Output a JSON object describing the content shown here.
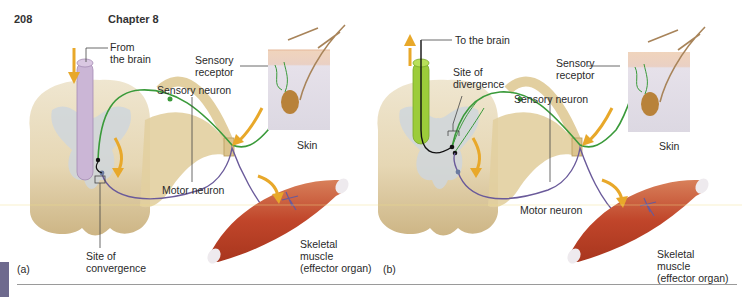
{
  "header": {
    "page_number": "208",
    "chapter": "Chapter 8"
  },
  "panel_a": {
    "letter": "(a)",
    "labels": {
      "from_brain": [
        "From",
        "the brain"
      ],
      "sensory_receptor": [
        "Sensory",
        "receptor"
      ],
      "sensory_neuron": "Sensory neuron",
      "skin": "Skin",
      "motor_neuron": "Motor neuron",
      "site": [
        "Site of",
        "convergence"
      ],
      "muscle": [
        "Skeletal",
        "muscle",
        "(effector organ)"
      ]
    }
  },
  "panel_b": {
    "letter": "(b)",
    "labels": {
      "to_brain": "To the brain",
      "site": [
        "Site of",
        "divergence"
      ],
      "sensory_receptor": [
        "Sensory",
        "receptor"
      ],
      "sensory_neuron": "Sensory neuron",
      "skin": "Skin",
      "motor_neuron": "Motor neuron",
      "muscle": [
        "Skeletal",
        "muscle",
        "(effector organ)"
      ]
    }
  },
  "colors": {
    "spinal_cord": "#e8dcc0",
    "gray_matter": "#cfd6dc",
    "nerve": "#e2cfa0",
    "sensory_neuron": "#3a9a3a",
    "motor_neuron": "#6a5a9a",
    "tract_a": "#cbb6d6",
    "tract_b": "#9ccc3a",
    "arrow": "#e8a82a",
    "skin_top": "#efd2b8",
    "skin_body": "#e4e0ea",
    "muscle": "#c8502e",
    "label_line": "#444444"
  }
}
